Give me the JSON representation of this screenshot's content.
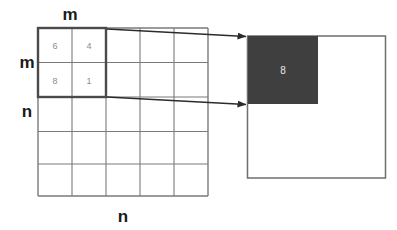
{
  "diagram": {
    "colors": {
      "grid_line": "#7a7a7a",
      "highlight_outline": "#4a4a4a",
      "fill_dark": "#3f3f3f",
      "label_text": "#1a1a1a",
      "cell_text": "#8c8c8c",
      "block_text": "#e8e8e8",
      "background": "#ffffff"
    },
    "left_grid": {
      "name": "source-matrix",
      "rows": 5,
      "cols": 5,
      "top_label": "m",
      "left_label_upper": "m",
      "left_label_lower": "n",
      "bottom_label": "n",
      "subblock": {
        "rows": 2,
        "cols": 2,
        "values": [
          [
            "6",
            "4"
          ],
          [
            "8",
            "1"
          ]
        ]
      }
    },
    "right_square": {
      "name": "result-matrix",
      "inner_block_label": "8"
    },
    "arrows": [
      {
        "name": "top-mapping-arrow",
        "from": "subblock-top-right",
        "to": "result-block-top-left"
      },
      {
        "name": "bottom-mapping-arrow",
        "from": "subblock-bottom-right",
        "to": "result-block-bottom-left"
      }
    ]
  }
}
